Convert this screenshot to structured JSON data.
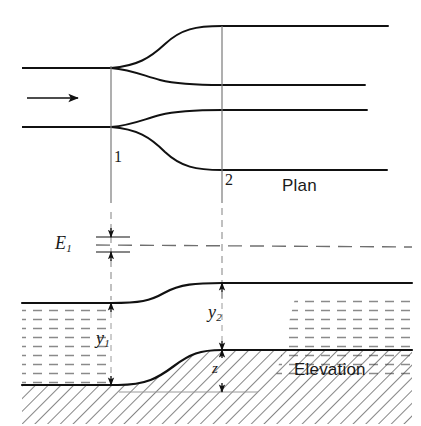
{
  "figure": {
    "type": "engineering-diagram",
    "views": [
      {
        "name": "plan",
        "label": "Plan"
      },
      {
        "name": "elevation",
        "label": "Elevation"
      }
    ],
    "sections": [
      {
        "id": "1",
        "label": "1",
        "description": "upstream section"
      },
      {
        "id": "2",
        "label": "2",
        "description": "downstream section"
      }
    ],
    "flow_arrow": {
      "name": "flow-direction-arrow",
      "direction": "left-to-right"
    },
    "labels": {
      "energy": {
        "symbol": "E",
        "subscript": "1"
      },
      "depth_upstream": {
        "symbol": "y",
        "subscript": "1"
      },
      "depth_downstream": {
        "symbol": "y",
        "subscript": "2"
      },
      "bed_rise": {
        "symbol": "z",
        "subscript": ""
      }
    },
    "colors": {
      "line": "#111111",
      "thin_line": "#6e6e6e",
      "hatch": "#2b2b2b",
      "water_hatch": "#8a8a8a",
      "background": "#ffffff"
    },
    "dimensions": [
      {
        "name": "E1",
        "orientation": "vertical",
        "arrows": "double"
      },
      {
        "name": "y1",
        "orientation": "vertical",
        "arrows": "double"
      },
      {
        "name": "y2",
        "orientation": "vertical",
        "arrows": "double"
      },
      {
        "name": "z",
        "orientation": "vertical",
        "arrows": "double"
      }
    ]
  }
}
